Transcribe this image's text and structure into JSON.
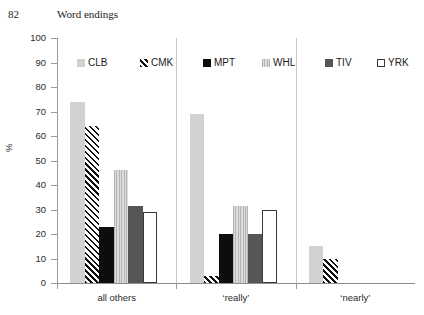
{
  "page": {
    "number": "82",
    "running_head": "Word endings"
  },
  "chart_data": {
    "type": "bar",
    "title": "",
    "subtitle": "",
    "xlabel": "",
    "ylabel": "%",
    "ylim": [
      0,
      100
    ],
    "ytick_step": 10,
    "ytick_labels": [
      "100",
      "90",
      "80",
      "70",
      "60",
      "50",
      "40",
      "30",
      "20",
      "10",
      "0"
    ],
    "grid": false,
    "legend_position": "top",
    "categories": [
      "all others",
      "‘really’",
      "‘nearly’"
    ],
    "series": [
      {
        "name": "CLB",
        "values": [
          74,
          69,
          15
        ],
        "color": "#d2d2d2",
        "swatch": "light-gray-solid"
      },
      {
        "name": "CMK",
        "values": [
          64,
          3,
          10
        ],
        "color": "#111111",
        "swatch": "diagonal-hatch"
      },
      {
        "name": "MPT",
        "values": [
          23,
          20,
          0
        ],
        "color": "#0d0d0d",
        "swatch": "black-solid"
      },
      {
        "name": "WHL",
        "values": [
          46,
          31.5,
          0
        ],
        "color": "#c8c8c8",
        "swatch": "vertical-texture"
      },
      {
        "name": "TIV",
        "values": [
          31.5,
          20,
          0
        ],
        "color": "#565656",
        "swatch": "dark-gray-solid"
      },
      {
        "name": "YRK",
        "values": [
          29,
          30,
          0
        ],
        "color": "#ffffff",
        "swatch": "white-outlined"
      }
    ]
  }
}
